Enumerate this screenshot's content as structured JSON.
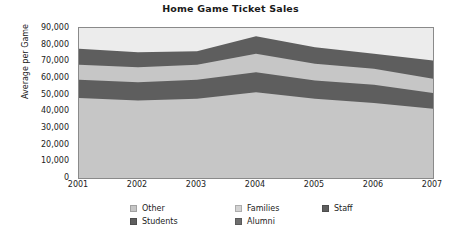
{
  "chart_data": {
    "type": "area",
    "stacked": true,
    "title": "Home Game Ticket Sales",
    "xlabel": "",
    "ylabel": "Average per Game",
    "categories": [
      "2001",
      "2002",
      "2003",
      "2004",
      "2005",
      "2006",
      "2007"
    ],
    "x": [
      2001,
      2002,
      2003,
      2004,
      2005,
      2006,
      2007
    ],
    "ylim": [
      0,
      90000
    ],
    "yticks": [
      "0",
      "10,000",
      "20,000",
      "30,000",
      "40,000",
      "50,000",
      "60,000",
      "70,000",
      "80,000",
      "90,000"
    ],
    "ytick_values": [
      0,
      10000,
      20000,
      30000,
      40000,
      50000,
      60000,
      70000,
      80000,
      90000
    ],
    "grid": false,
    "legend_position": "bottom",
    "series": [
      {
        "name": "Other",
        "color": "#c6c6c6",
        "values": [
          48000,
          46500,
          47500,
          51500,
          47500,
          45000,
          41500
        ],
        "cumulative": [
          48000,
          46500,
          47500,
          51500,
          47500,
          45000,
          41500
        ]
      },
      {
        "name": "Students",
        "color": "#5e5e5e",
        "values": [
          11000,
          11000,
          11500,
          12000,
          11000,
          11000,
          9500
        ],
        "cumulative": [
          59000,
          57500,
          59000,
          63500,
          58500,
          56000,
          51000
        ]
      },
      {
        "name": "Families",
        "color": "#c6c6c6",
        "values": [
          9000,
          9000,
          9000,
          11000,
          10000,
          9500,
          8500
        ],
        "cumulative": [
          68000,
          66500,
          68000,
          74500,
          68500,
          65500,
          59500
        ]
      },
      {
        "name": "Alumni",
        "color": "#5e5e5e",
        "values": [
          9500,
          9000,
          8000,
          10500,
          10000,
          9000,
          11000
        ],
        "cumulative": [
          77500,
          75500,
          76000,
          85000,
          78500,
          74500,
          70500
        ]
      },
      {
        "name": "Staff",
        "color": "#ececec",
        "values": [
          12500,
          14500,
          14000,
          5000,
          11500,
          15500,
          19500
        ],
        "cumulative": [
          90000,
          90000,
          90000,
          90000,
          90000,
          90000,
          90000
        ]
      }
    ]
  },
  "legend": {
    "rows": [
      [
        {
          "label": "Other",
          "color": "#c6c6c6"
        },
        {
          "label": "Families",
          "color": "#d3d3d3"
        },
        {
          "label": "Staff",
          "color": "#5e5e5e"
        }
      ],
      [
        {
          "label": "Students",
          "color": "#5e5e5e"
        },
        {
          "label": "Alumni",
          "color": "#6e6e6e"
        }
      ]
    ]
  },
  "colors": {
    "plot_border": "#8a8a8a",
    "text": "#222222",
    "title": "#1a1a1a",
    "background": "#ffffff"
  }
}
